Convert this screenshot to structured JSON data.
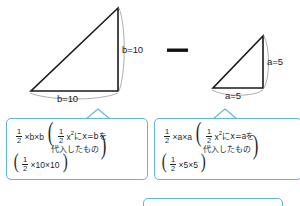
{
  "figure": {
    "type": "geometry-subtraction-diagram",
    "operator": "—",
    "operator_name": "minus-sign",
    "left_triangle": {
      "name": "large-right-triangle",
      "vertical_side_label": "b=10",
      "horizontal_side_label": "b=10",
      "base": 10,
      "height": 10
    },
    "right_triangle": {
      "name": "small-right-triangle",
      "vertical_side_label": "a=5",
      "horizontal_side_label": "a=5",
      "base": 5,
      "height": 5
    }
  },
  "callouts": {
    "left": {
      "line1_prefix": "×b×b",
      "line1_inner_term": "x",
      "line1_inner_sup": "2",
      "line1_inner_suffix": "にx=bを",
      "line2": "代入したもの",
      "line3_suffix": "×10×10",
      "numerator": "1",
      "denominator": "2"
    },
    "right": {
      "line1_prefix": "×a×a",
      "line1_inner_term": "x",
      "line1_inner_sup": "2",
      "line1_inner_suffix": "にx=aを",
      "line2": "代入したもの",
      "line3_suffix": "×5×5",
      "numerator": "1",
      "denominator": "2"
    }
  },
  "colors": {
    "callout_border": "#63b6d8",
    "stroke": "#1a1a1a",
    "brace": "#8a8a8a",
    "text": "#1f1f1f",
    "background": "#ffffff"
  }
}
